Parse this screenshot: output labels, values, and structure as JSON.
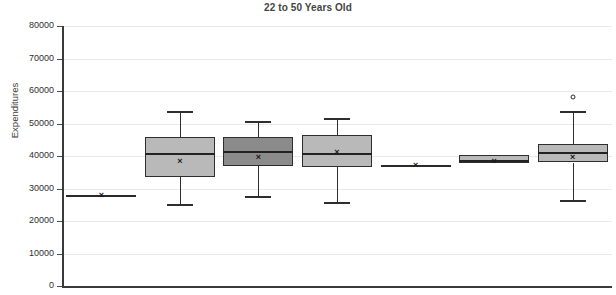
{
  "chart_data": {
    "type": "box",
    "title": "22 to 50 Years Old",
    "xlabel": "",
    "ylabel": "Expenditures",
    "ylim": [
      0,
      80000
    ],
    "ytick_step": 10000,
    "yticks": [
      80000,
      70000,
      60000,
      50000,
      40000,
      30000,
      20000,
      10000,
      0
    ],
    "ytick_labels": [
      "80000",
      "70000",
      "60000",
      "50000",
      "40000",
      "30000",
      "20000",
      "10000",
      "0"
    ],
    "grid": true,
    "legend": "none",
    "xtick_labels": [],
    "categories": [
      "1",
      "2",
      "3",
      "4",
      "5",
      "6",
      "7"
    ],
    "boxes": [
      {
        "name": "1",
        "whisker_low": 28000,
        "q1": 28000,
        "median": 28000,
        "q3": 28000,
        "whisker_high": 28000,
        "mean": 28000,
        "outliers": [],
        "fill": "#b9b9b9",
        "degenerate": true
      },
      {
        "name": "2",
        "whisker_low": 25200,
        "q1": 33500,
        "median": 40900,
        "q3": 46000,
        "whisker_high": 54000,
        "mean": 38600,
        "outliers": [],
        "fill": "#b9b9b9",
        "degenerate": false
      },
      {
        "name": "3",
        "whisker_low": 27800,
        "q1": 36900,
        "median": 41500,
        "q3": 45800,
        "whisker_high": 50800,
        "mean": 39800,
        "outliers": [],
        "fill": "#8b8b8b",
        "degenerate": false
      },
      {
        "name": "4",
        "whisker_low": 25800,
        "q1": 36600,
        "median": 40900,
        "q3": 46500,
        "whisker_high": 51700,
        "mean": 41200,
        "outliers": [],
        "fill": "#b9b9b9",
        "degenerate": false
      },
      {
        "name": "5",
        "whisker_low": 37200,
        "q1": 37200,
        "median": 37200,
        "q3": 37200,
        "whisker_high": 37200,
        "mean": 37200,
        "outliers": [],
        "fill": "#b9b9b9",
        "degenerate": true
      },
      {
        "name": "6",
        "whisker_low": 37800,
        "q1": 37800,
        "median": 38900,
        "q3": 40300,
        "whisker_high": 40300,
        "mean": 38600,
        "outliers": [],
        "fill": "#b9b9b9",
        "degenerate": false
      },
      {
        "name": "7",
        "whisker_low": 26400,
        "q1": 38000,
        "median": 41200,
        "q3": 43800,
        "whisker_high": 53800,
        "mean": 39700,
        "outliers": [
          58200
        ],
        "fill": "#b9b9b9",
        "degenerate": false
      }
    ],
    "mean_marker": "×",
    "outlier_marker": "○",
    "colors": {
      "box_fill_light": "#b9b9b9",
      "box_fill_dark": "#8b8b8b",
      "box_edge": "#2e2e2e",
      "gridline": "#e9e9e9",
      "axis": "#3a3a3a",
      "title": "#444444",
      "tick_text": "#2f2f2f"
    }
  }
}
